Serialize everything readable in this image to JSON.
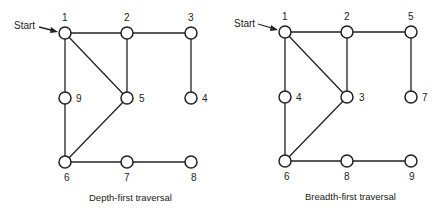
{
  "diagrams": [
    {
      "caption": "Depth-first traversal",
      "start_label": "Start",
      "nodes": [
        {
          "label": "1",
          "pos": "top-left"
        },
        {
          "label": "2",
          "pos": "top-middle"
        },
        {
          "label": "3",
          "pos": "top-right"
        },
        {
          "label": "9",
          "pos": "middle-left"
        },
        {
          "label": "5",
          "pos": "middle-middle"
        },
        {
          "label": "4",
          "pos": "middle-right"
        },
        {
          "label": "6",
          "pos": "bottom-left"
        },
        {
          "label": "7",
          "pos": "bottom-middle"
        },
        {
          "label": "8",
          "pos": "bottom-right"
        }
      ],
      "edges": [
        [
          "1",
          "2"
        ],
        [
          "2",
          "3"
        ],
        [
          "1",
          "9"
        ],
        [
          "1",
          "5"
        ],
        [
          "2",
          "5"
        ],
        [
          "3",
          "4"
        ],
        [
          "9",
          "6"
        ],
        [
          "5",
          "6"
        ],
        [
          "6",
          "7"
        ],
        [
          "7",
          "8"
        ]
      ]
    },
    {
      "caption": "Breadth-first traversal",
      "start_label": "Start",
      "nodes": [
        {
          "label": "1",
          "pos": "top-left"
        },
        {
          "label": "2",
          "pos": "top-middle"
        },
        {
          "label": "5",
          "pos": "top-right"
        },
        {
          "label": "4",
          "pos": "middle-left"
        },
        {
          "label": "3",
          "pos": "middle-middle"
        },
        {
          "label": "7",
          "pos": "middle-right"
        },
        {
          "label": "6",
          "pos": "bottom-left"
        },
        {
          "label": "8",
          "pos": "bottom-middle"
        },
        {
          "label": "9",
          "pos": "bottom-right"
        }
      ],
      "edges": [
        [
          "1",
          "2"
        ],
        [
          "2",
          "5"
        ],
        [
          "1",
          "4"
        ],
        [
          "1",
          "3"
        ],
        [
          "2",
          "3"
        ],
        [
          "5",
          "7"
        ],
        [
          "4",
          "6"
        ],
        [
          "3",
          "6"
        ],
        [
          "6",
          "8"
        ],
        [
          "8",
          "9"
        ]
      ]
    }
  ]
}
